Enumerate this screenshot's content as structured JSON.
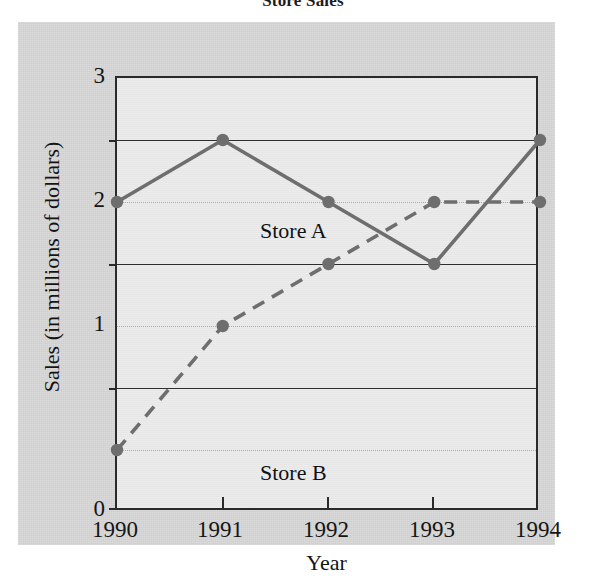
{
  "chart_data": {
    "type": "line",
    "title": "Store Sales",
    "xlabel": "Year",
    "ylabel": "Sales (in millions of dollars)",
    "categories": [
      "1990",
      "1991",
      "1992",
      "1993",
      "1994"
    ],
    "x": [
      1990,
      1991,
      1992,
      1993,
      1994
    ],
    "xlim": [
      1990,
      1994
    ],
    "ylim": [
      0,
      3.5
    ],
    "y_ticks": [
      0,
      1,
      2,
      3
    ],
    "y_tick_labels": [
      "0",
      "1",
      "2",
      "3"
    ],
    "y_minor_gridlines": [
      0.5,
      1.5,
      2.5
    ],
    "grid": true,
    "legend_position": "in-plot-annotations",
    "series": [
      {
        "name": "Store A",
        "values": [
          2.5,
          3.0,
          2.5,
          2.0,
          3.0
        ],
        "line_style": "solid",
        "marker": "circle",
        "color": "#6e6e6e",
        "label_position": "inside-upper-left"
      },
      {
        "name": "Store B",
        "values": [
          0.5,
          1.5,
          2.0,
          2.5,
          2.5
        ],
        "line_style": "dashed",
        "marker": "circle",
        "color": "#6e6e6e",
        "label_position": "inside-lower-left"
      }
    ],
    "annotations": [
      "Store A",
      "Store B"
    ]
  },
  "figure": {
    "title": "Store Sales",
    "panel_background": "#d3d3d3",
    "plot_background": "#e8e8e8",
    "frame_color": "#2a2a2a",
    "series_color": "#6e6e6e",
    "gridline_major_color": "#2d2d2d",
    "gridline_minor_color": "#a9a9a9"
  },
  "axes": {
    "y_title": "Sales (in millions of dollars)",
    "x_title": "Year",
    "y_labels": [
      "3",
      "2",
      "1",
      "0"
    ],
    "x_labels": [
      "1990",
      "1991",
      "1992",
      "1993",
      "1994"
    ]
  },
  "labels": {
    "store_a": "Store A",
    "store_b": "Store B"
  }
}
